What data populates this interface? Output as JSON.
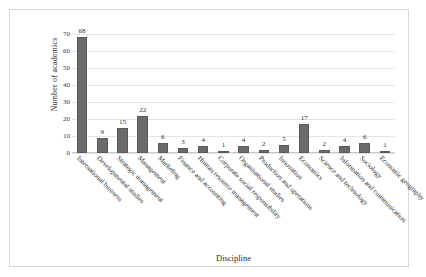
{
  "chart_data": {
    "type": "bar",
    "title": "",
    "xlabel": "Discipline",
    "ylabel": "Number of academics",
    "ylim": [
      0,
      70
    ],
    "ytick_step": 10,
    "yticks": [
      0,
      10,
      20,
      30,
      40,
      50,
      60,
      70
    ],
    "grid": true,
    "legend": "none",
    "bar_color": "#6b6b6b",
    "categories": [
      "International business",
      "Developmental studies",
      "Strategic management",
      "Management",
      "Marketing",
      "Finance and accounting",
      "Human resource management",
      "Corporate social responsibility",
      "Organisational studies",
      "Production and operations",
      "Innovation",
      "Economics",
      "Science and technology",
      "Information and communication",
      "Sociology",
      "Economic geography"
    ],
    "values": [
      68,
      9,
      15,
      22,
      6,
      3,
      4,
      1,
      4,
      2,
      5,
      17,
      2,
      4,
      6,
      1
    ]
  }
}
